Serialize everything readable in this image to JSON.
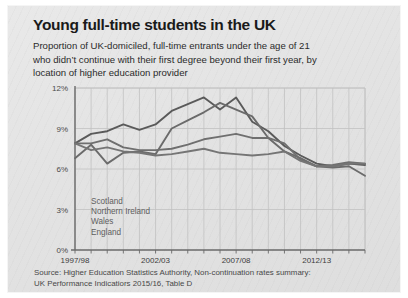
{
  "card": {
    "title": "Young full-time students in the UK",
    "subtitle_lines": [
      "Proportion of UK-domiciled, full-time entrants under the age of 21",
      "who didn’t continue with their first degree beyond their first year, by",
      "location of higher education provider"
    ],
    "source_lines": [
      "Source: Higher Education Statistics Authority, Non-continuation rates summary:",
      "UK Performance Indicatiors 2015/16, Table D"
    ],
    "colors": {
      "card_background": "#e5e5e5",
      "title_text": "#1a1a1a",
      "subtitle_text": "#2b2b2b",
      "source_text": "#484848",
      "grid": "#c2c2c2",
      "axis": "#6a6a6a",
      "legend_text": "#5e5e5e"
    }
  },
  "chart_data": {
    "type": "line",
    "title": "Young full-time students in the UK",
    "subtitle": "Proportion of UK-domiciled, full-time entrants under the age of 21 who didn’t continue with their first degree beyond their first year, by location of higher education provider",
    "xlabel": "",
    "ylabel": "",
    "ylim": [
      0,
      12
    ],
    "yticks": [
      0,
      3,
      6,
      9,
      12
    ],
    "ytick_labels": [
      "0%",
      "3%",
      "6%",
      "9%",
      "12%"
    ],
    "grid": true,
    "legend_position": "inside-lower-left",
    "x": [
      "1997/98",
      "1998/99",
      "1999/00",
      "2000/01",
      "2001/02",
      "2002/03",
      "2003/04",
      "2004/05",
      "2005/06",
      "2006/07",
      "2007/08",
      "2008/09",
      "2009/10",
      "2010/11",
      "2011/12",
      "2012/13",
      "2013/14",
      "2014/15",
      "2015/16"
    ],
    "xtick_labels": [
      "1997/98",
      "2002/03",
      "2007/08",
      "2012/13"
    ],
    "xtick_indices": [
      0,
      5,
      10,
      15
    ],
    "series": [
      {
        "name": "Scotland",
        "color": "#5a5a5a",
        "values": [
          7.9,
          8.6,
          8.8,
          9.3,
          8.9,
          9.3,
          10.3,
          10.8,
          11.3,
          10.4,
          11.3,
          9.5,
          8.8,
          7.7,
          7.0,
          6.4,
          6.2,
          6.4,
          6.3
        ]
      },
      {
        "name": "Northern Ireland",
        "color": "#6b6b6b",
        "values": [
          6.8,
          7.8,
          6.4,
          7.2,
          7.3,
          7.1,
          9.0,
          9.6,
          10.2,
          10.9,
          10.4,
          9.9,
          8.3,
          7.3,
          6.8,
          6.2,
          6.1,
          6.2,
          5.5
        ]
      },
      {
        "name": "Wales",
        "color": "#6f6f6f",
        "values": [
          7.9,
          7.9,
          8.2,
          7.6,
          7.4,
          7.4,
          7.5,
          7.8,
          8.2,
          8.4,
          8.6,
          8.3,
          8.3,
          7.9,
          6.7,
          6.2,
          6.3,
          6.5,
          6.4
        ]
      },
      {
        "name": "England",
        "color": "#757575",
        "values": [
          7.9,
          7.4,
          7.6,
          7.3,
          7.2,
          7.0,
          7.1,
          7.3,
          7.5,
          7.2,
          7.1,
          7.0,
          7.1,
          7.3,
          6.6,
          6.2,
          6.2,
          6.4,
          6.4
        ]
      }
    ]
  },
  "legend": {
    "items": [
      {
        "label": "Scotland"
      },
      {
        "label": "Northern Ireland"
      },
      {
        "label": "Wales"
      },
      {
        "label": "England"
      }
    ]
  }
}
